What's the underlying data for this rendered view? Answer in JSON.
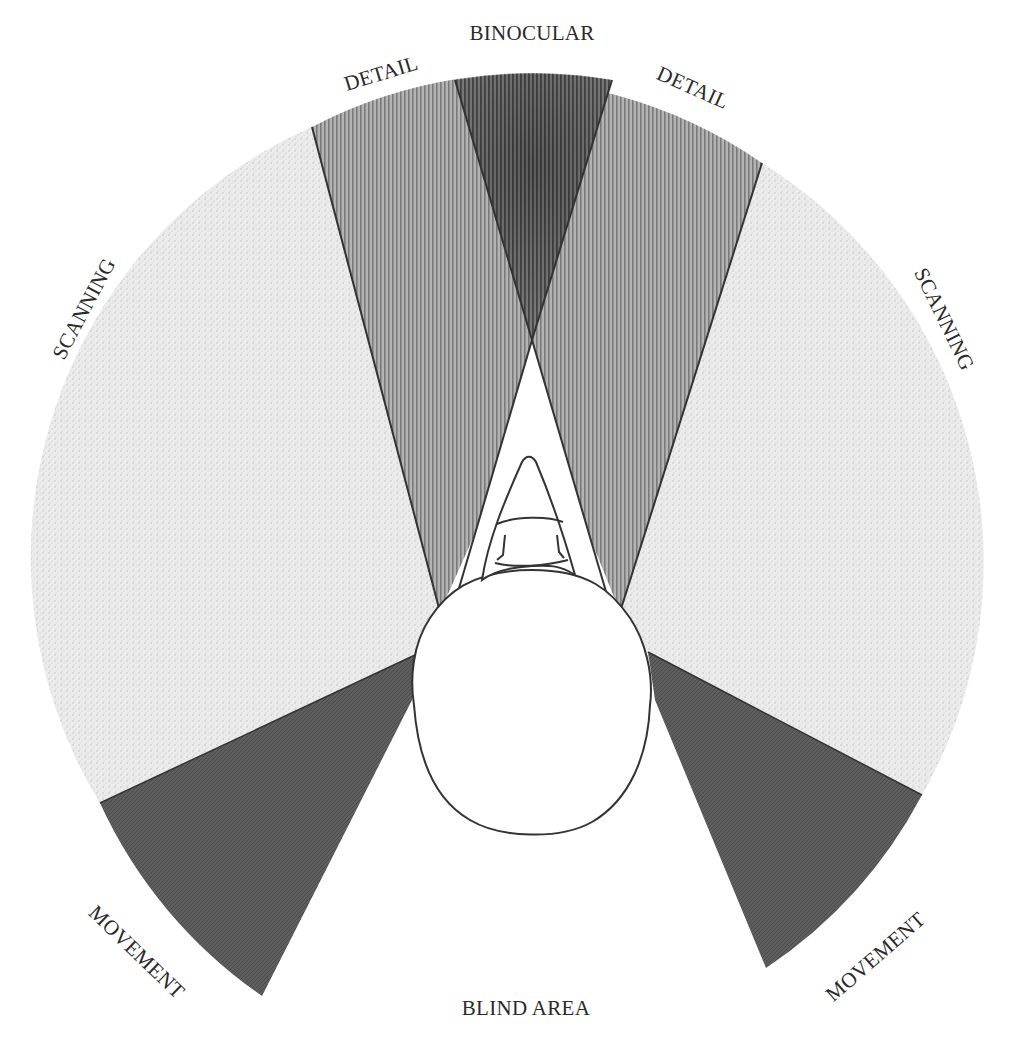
{
  "diagram": {
    "labels": {
      "binocular": "BINOCULAR",
      "detail_left": "DETAIL",
      "detail_right": "DETAIL",
      "scanning_left": "SCANNING",
      "scanning_right": "SCANNING",
      "movement_left": "MOVEMENT",
      "movement_right": "MOVEMENT",
      "blind_area": "BLIND AREA"
    },
    "zones": [
      {
        "name": "binocular",
        "shade": "darkest vertical hatch",
        "color": "#5a5a5a"
      },
      {
        "name": "detail",
        "shade": "medium vertical hatch",
        "color": "#9a9a9a"
      },
      {
        "name": "scanning",
        "shade": "light stipple",
        "color": "#e2e2e2"
      },
      {
        "name": "movement",
        "shade": "dark fill",
        "color": "#5c5c5c"
      },
      {
        "name": "blind_area",
        "shade": "none",
        "color": "#ffffff"
      }
    ],
    "colors": {
      "background": "#ffffff",
      "outline": "#333333",
      "text": "#2a2a2a"
    }
  }
}
